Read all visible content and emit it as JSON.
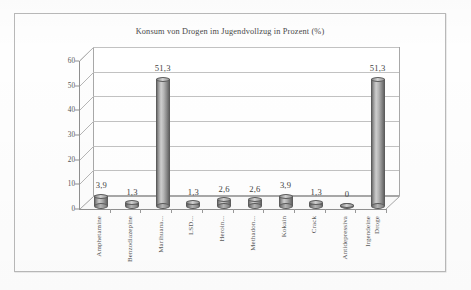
{
  "chart_data": {
    "type": "bar",
    "title": "Konsum von Drogen im Jugendvollzug in Prozent (%)",
    "xlabel": "",
    "ylabel": "",
    "ylim": [
      0,
      60
    ],
    "yticks": [
      0,
      10,
      20,
      30,
      40,
      50,
      60
    ],
    "grid": true,
    "legend": "none",
    "style": "3d-cylinder",
    "categories": [
      "Amphetamine",
      "Benzodiazepine",
      "Marihuana...",
      "LSD...",
      "Heroin...",
      "Methadon...",
      "Kokain",
      "Crack",
      "Antidepressiva",
      "Irgendeine Droge"
    ],
    "values": [
      3.9,
      1.3,
      51.3,
      1.3,
      2.6,
      2.6,
      3.9,
      1.3,
      0,
      51.3
    ],
    "value_labels": [
      "3,9",
      "1,3",
      "51,3",
      "1,3",
      "2,6",
      "2,6",
      "3,9",
      "1,3",
      "0",
      "51,3"
    ],
    "tick_labels": [
      "0",
      "10",
      "20",
      "30",
      "40",
      "50",
      "60"
    ],
    "category_labels_display": [
      "Amphetamine",
      "Benzodiazepine",
      "Marihuana...",
      "LSD...",
      "Heroin...",
      "Methadon...",
      "Kokain",
      "Crack",
      "Antidepressiva",
      "Irgendeine\nDroge"
    ],
    "colors": {
      "bar_light": "#cfcfcf",
      "bar_dark": "#656565",
      "grid": "#c2c2c2",
      "axis": "#8f8f8f",
      "text": "#4a4a4a",
      "frame": "#b9b9b9",
      "background": "#fefefe"
    }
  }
}
